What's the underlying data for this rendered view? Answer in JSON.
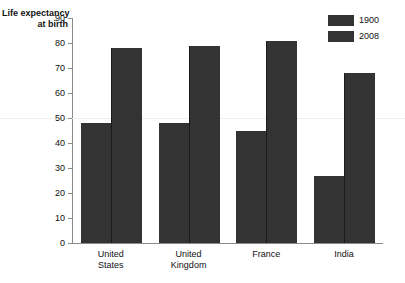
{
  "chart_data": {
    "type": "bar",
    "title": "Life expectancy at birth",
    "title_lines": [
      "Life expectancy",
      "at birth"
    ],
    "xlabel": "",
    "ylabel": "Life expectancy at birth",
    "ylim": [
      0,
      90
    ],
    "ytick_step": 10,
    "yticks": [
      0,
      10,
      20,
      30,
      40,
      50,
      60,
      70,
      80,
      90
    ],
    "ytick_labels": [
      "0",
      "10",
      "20",
      "30",
      "40",
      "50",
      "60",
      "70",
      "80",
      "90"
    ],
    "categories": [
      "United States",
      "United Kingdom",
      "France",
      "India"
    ],
    "category_lines": [
      [
        "United",
        "States"
      ],
      [
        "United",
        "Kingdom"
      ],
      [
        "France"
      ],
      [
        "India"
      ]
    ],
    "series": [
      {
        "name": "1900",
        "values": [
          48,
          48,
          45,
          27
        ],
        "color": "#333333"
      },
      {
        "name": "2008",
        "values": [
          78,
          79,
          81,
          68
        ],
        "color": "#333333"
      }
    ],
    "legend": [
      "1900",
      "2008"
    ],
    "legend_position": "top-right",
    "grid": false,
    "bar_color": "#333333",
    "axis_color": "#8a8a8a"
  }
}
